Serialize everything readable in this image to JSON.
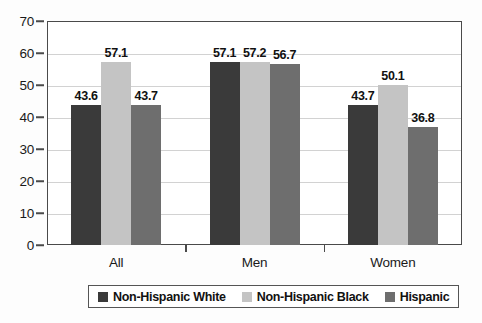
{
  "chart_data": {
    "type": "bar",
    "title": "",
    "subtitle": "",
    "xlabel": "",
    "ylabel": "",
    "categories": [
      "All",
      "Men",
      "Women"
    ],
    "series": [
      {
        "name": "Non-Hispanic White",
        "color": "#3a3a3a",
        "values": [
          43.6,
          57.1,
          43.7
        ]
      },
      {
        "name": "Non-Hispanic Black",
        "color": "#c4c4c4",
        "values": [
          57.1,
          57.2,
          50.1
        ]
      },
      {
        "name": "Hispanic",
        "color": "#6e6e6e",
        "values": [
          43.7,
          56.7,
          36.8
        ]
      }
    ],
    "ylim": [
      0,
      70
    ],
    "yticks": [
      0,
      10,
      20,
      30,
      40,
      50,
      60,
      70
    ],
    "ytick_labels": [
      "0",
      "10",
      "20",
      "30",
      "40",
      "50",
      "60",
      "70"
    ],
    "grid": true,
    "grid_axis": "y",
    "legend_position": "bottom",
    "data_labels": true,
    "data_label_values": [
      [
        "43.6",
        "57.1",
        "43.7"
      ],
      [
        "57.1",
        "57.2",
        "56.7"
      ],
      [
        "43.7",
        "50.1",
        "36.8"
      ]
    ]
  },
  "colors": {
    "series_1": "#3a3a3a",
    "series_2": "#c4c4c4",
    "series_3": "#6e6e6e",
    "axis": "#4a4a4a",
    "gridline": "#d2d2d2",
    "background": "#fdfdfd",
    "plot_background": "#ffffff",
    "text": "#111111"
  }
}
